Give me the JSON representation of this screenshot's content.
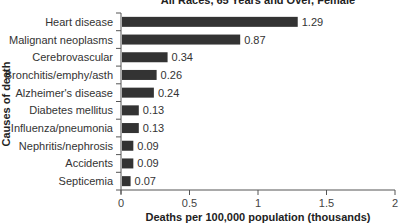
{
  "chart_data": {
    "type": "bar",
    "orientation": "horizontal",
    "title": "All Races, 65 Years and Over, Female",
    "xlabel": "Deaths per 100,000 population (thousands)",
    "ylabel": "Causes of death",
    "xlim": [
      0,
      2
    ],
    "xticks": [
      0,
      0.5,
      1,
      1.5,
      2
    ],
    "xtick_labels": [
      "0",
      "0.5",
      "1",
      "1.5",
      "2"
    ],
    "grid": false,
    "categories": [
      "Heart disease",
      "Malignant neoplasms",
      "Cerebrovascular",
      "Bronchitis/emphy/asth",
      "Alzheimer's disease",
      "Diabetes mellitus",
      "Influenza/pneumonia",
      "Nephritis/nephrosis",
      "Accidents",
      "Septicemia"
    ],
    "values": [
      1.29,
      0.87,
      0.34,
      0.26,
      0.24,
      0.13,
      0.13,
      0.09,
      0.09,
      0.07
    ],
    "value_labels": [
      "1.29",
      "0.87",
      "0.34",
      "0.26",
      "0.24",
      "0.13",
      "0.13",
      "0.09",
      "0.09",
      "0.07"
    ],
    "bar_color": "#333333"
  }
}
